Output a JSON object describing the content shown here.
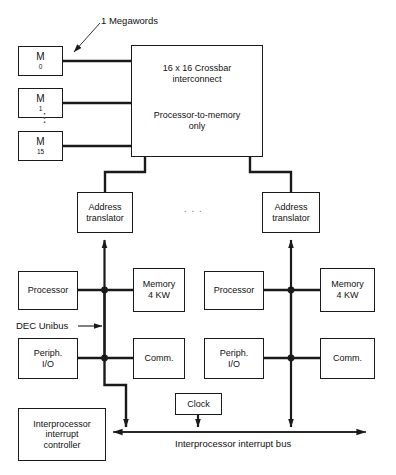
{
  "diagram": {
    "title_note": "1 Megawords",
    "memory_modules": [
      {
        "name": "M",
        "index": "0"
      },
      {
        "name": "M",
        "index": "1"
      },
      {
        "name": "M",
        "index": "15"
      }
    ],
    "vertical_ellipsis": "⋮",
    "horizontal_ellipsis": ". . .",
    "crossbar": {
      "line1": "16 x 16 Crossbar",
      "line2": "interconnect",
      "line3": "Processor-to-memory",
      "line4": "only"
    },
    "address_translator": {
      "line1": "Address",
      "line2": "translator"
    },
    "clusters": [
      {
        "processor": "Processor",
        "memory_line1": "Memory",
        "memory_line2": "4 KW",
        "periph_line1": "Periph.",
        "periph_line2": "I/O",
        "comm": "Comm."
      },
      {
        "processor": "Processor",
        "memory_line1": "Memory",
        "memory_line2": "4 KW",
        "periph_line1": "Periph.",
        "periph_line2": "I/O",
        "comm": "Comm."
      }
    ],
    "unibus_label": "DEC Unibus",
    "clock": "Clock",
    "interrupt_controller": {
      "line1": "Interprocessor",
      "line2": "interrupt",
      "line3": "controller"
    },
    "interrupt_bus_label": "Interprocessor interrupt bus",
    "colors": {
      "stroke": "#1a1a1a",
      "background": "#ffffff",
      "text": "#111111"
    }
  }
}
